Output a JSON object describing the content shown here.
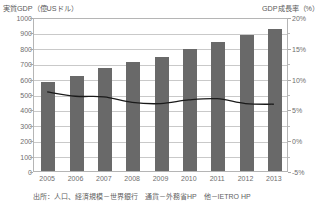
{
  "chart_data": {
    "type": "bar",
    "title": "",
    "categories": [
      "2005",
      "2006",
      "2007",
      "2008",
      "2009",
      "2010",
      "2011",
      "2012",
      "2013"
    ],
    "xlabel": "",
    "ylabel": "実質GDP（億USドル）",
    "y2label": "GDP成長率（%）",
    "ylim": [
      0,
      1000
    ],
    "y2lim": [
      -5,
      20
    ],
    "grid": true,
    "legend": "none",
    "yticks": [
      "0",
      "100",
      "200",
      "300",
      "400",
      "500",
      "600",
      "700",
      "800",
      "900",
      "1000"
    ],
    "y2ticks": [
      "-5%",
      "0%",
      "5%",
      "10%",
      "15%",
      "20%"
    ],
    "series": [
      {
        "name": "実質GDP（億USドル）",
        "type": "bar",
        "axis": "left",
        "color": "#696969",
        "values": [
          580,
          615,
          668,
          705,
          742,
          790,
          840,
          882,
          925
        ]
      },
      {
        "name": "GDP成長率（%）",
        "type": "line",
        "axis": "right",
        "color": "#1a1a1a",
        "values": [
          8.0,
          7.3,
          7.2,
          6.3,
          6.1,
          6.7,
          6.9,
          6.1,
          6.0
        ]
      }
    ],
    "annotations": []
  },
  "header": {
    "left_axis_title": "実質GDP（億USドル）",
    "right_axis_title": "GDP成長率（%）"
  },
  "footer": {
    "source": "出所：人口、経済規模－世界銀行　通貨－外務省HP　他－IETRO HP"
  }
}
